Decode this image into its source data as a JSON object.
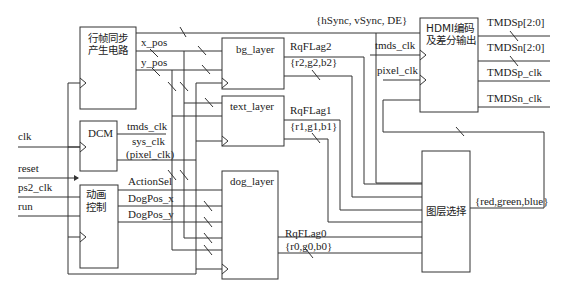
{
  "diagram": {
    "type": "hdmi-video-system-block-diagram",
    "blocks": {
      "sync_gen": {
        "line1": "行帧同步",
        "line2": "产生电路"
      },
      "dcm": {
        "label": "DCM"
      },
      "anim_ctrl": {
        "line1": "动画",
        "line2": "控制"
      },
      "bg_layer": {
        "label": "bg_layer"
      },
      "text_layer": {
        "label": "text_layer"
      },
      "dog_layer": {
        "label": "dog_layer"
      },
      "hdmi": {
        "line1": "HDMI编码",
        "line2": "及差分输出"
      },
      "layer_sel": {
        "label": "图层选择"
      }
    },
    "inputs": {
      "clk": "clk",
      "reset": "reset",
      "ps2_clk": "ps2_clk",
      "run": "run"
    },
    "signals": {
      "x_pos": "x_pos",
      "y_pos": "y_pos",
      "sync_bus": "{hSync, vSync, DE}",
      "tmds_clk": "tmds_clk",
      "sys_clk": "sys_clk",
      "pixel_clk_paren": "(pixel_clk)",
      "action_sel": "ActionSel",
      "dogpos_x": "DogPos_x",
      "dogpos_y": "DogPos_y",
      "rqflag2": "RqFLag2",
      "rgb2": "{r2,g2,b2}",
      "rqflag1": "RqFLag1",
      "rgb1": "{r1,g1,b1}",
      "rqflag0": "RqFLag0",
      "rgb0": "{r0,g0,b0}",
      "hdmi_tmds_clk": "tmds_clk",
      "hdmi_pixel_clk": "pixel_clk",
      "rgb_out": "{red,green,blue}"
    },
    "outputs": {
      "tmdsp": "TMDSp[2:0]",
      "tmdsn": "TMDSn[2:0]",
      "tmdsp_clk": "TMDSp_clk",
      "tmdsn_clk": "TMDSn_clk"
    }
  }
}
